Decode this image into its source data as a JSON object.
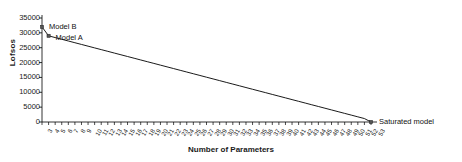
{
  "chart_data": {
    "type": "line",
    "title": "",
    "xlabel": "Number of Parameters",
    "ylabel": "Lofsos",
    "xlim": [
      3,
      53
    ],
    "ylim": [
      0,
      35000
    ],
    "yticks": [
      35000,
      30000,
      25000,
      20000,
      15000,
      10000,
      5000,
      0
    ],
    "ytick_labels": [
      "35000",
      "30000",
      "25000",
      "20000",
      "15000",
      "10000",
      "5000",
      "0"
    ],
    "grid": false,
    "legend": "none",
    "x": [
      3,
      4,
      5,
      6,
      7,
      8,
      9,
      10,
      11,
      12,
      13,
      14,
      15,
      16,
      17,
      18,
      19,
      20,
      21,
      22,
      23,
      24,
      25,
      26,
      27,
      28,
      29,
      30,
      31,
      32,
      33,
      34,
      35,
      36,
      37,
      38,
      39,
      40,
      41,
      42,
      43,
      44,
      45,
      46,
      47,
      48,
      49,
      50,
      51,
      52,
      53
    ],
    "xtick_labels": [
      "3",
      "4",
      "5",
      "6",
      "7",
      "8",
      "9",
      "10",
      "11",
      "12",
      "13",
      "14",
      "15",
      "16",
      "17",
      "18",
      "19",
      "20",
      "21",
      "22",
      "23",
      "24",
      "25",
      "26",
      "27",
      "28",
      "29",
      "30",
      "31",
      "32",
      "33",
      "34",
      "35",
      "36",
      "37",
      "38",
      "39",
      "40",
      "41",
      "42",
      "43",
      "44",
      "45",
      "46",
      "47",
      "48",
      "49",
      "50",
      "51",
      "52",
      "53"
    ],
    "series": [
      {
        "name": "Logloss",
        "color": "#000000",
        "values": [
          32000,
          29000,
          28420,
          27840,
          27260,
          26680,
          26100,
          25520,
          24940,
          24360,
          23780,
          23200,
          22620,
          22040,
          21460,
          20880,
          20300,
          19720,
          19140,
          18560,
          17980,
          17400,
          16820,
          16240,
          15660,
          15080,
          14500,
          13920,
          13340,
          12760,
          12180,
          11600,
          11020,
          10440,
          9860,
          9280,
          8700,
          8120,
          7540,
          6960,
          6380,
          5800,
          5220,
          4640,
          4060,
          3480,
          2900,
          2320,
          1740,
          1160,
          0
        ]
      }
    ],
    "markers": [
      {
        "name": "model-b",
        "x": 3,
        "y": 32000,
        "label": "Model B",
        "label_dx": 7,
        "label_dy": -4
      },
      {
        "name": "model-a",
        "x": 4,
        "y": 29000,
        "label": "Model A",
        "label_dx": 7,
        "label_dy": -2
      },
      {
        "name": "saturated-model",
        "x": 53,
        "y": 0,
        "label": "Saturated model",
        "label_dx": 8,
        "label_dy": -4
      }
    ]
  }
}
